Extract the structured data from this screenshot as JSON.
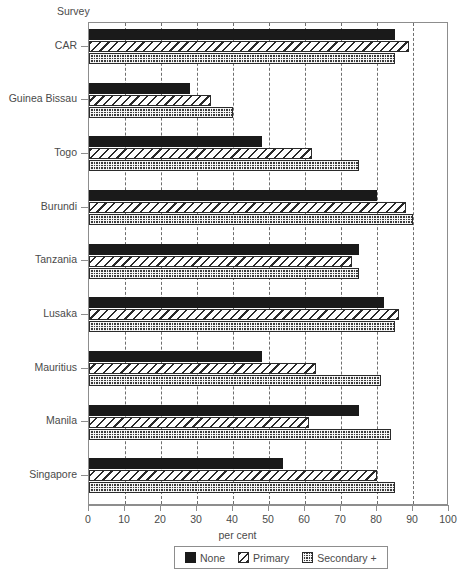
{
  "chart_data": {
    "type": "bar",
    "orientation": "horizontal",
    "title": "",
    "xlabel": "per cent",
    "ylabel": "Survey",
    "xlim": [
      0,
      100
    ],
    "xticks": [
      0,
      10,
      20,
      30,
      40,
      50,
      60,
      70,
      80,
      90,
      100
    ],
    "grid": "vertical-dashed",
    "legend_position": "bottom",
    "categories": [
      "CAR",
      "Guinea Bissau",
      "Togo",
      "Burundi",
      "Tanzania",
      "Lusaka",
      "Mauritius",
      "Manila",
      "Singapore"
    ],
    "series": [
      {
        "name": "None",
        "values": [
          85,
          28,
          48,
          80,
          75,
          82,
          48,
          75,
          54
        ]
      },
      {
        "name": "Primary",
        "values": [
          89,
          34,
          62,
          88,
          73,
          86,
          63,
          61,
          80
        ]
      },
      {
        "name": "Secondary +",
        "values": [
          85,
          40,
          75,
          90,
          75,
          85,
          81,
          84,
          85
        ]
      }
    ],
    "colors": {
      "none": "#1a1a1a",
      "primary": "#ffffff",
      "secondary": "#3c3c3c",
      "axis": "#8d8d8d",
      "text": "#4a4a4a",
      "background": "#ffffff"
    }
  },
  "legend": {
    "items": [
      {
        "label": "None",
        "pattern": "solid-black"
      },
      {
        "label": "Primary",
        "pattern": "diagonal-hatch"
      },
      {
        "label": "Secondary +",
        "pattern": "cross-dot"
      }
    ]
  }
}
